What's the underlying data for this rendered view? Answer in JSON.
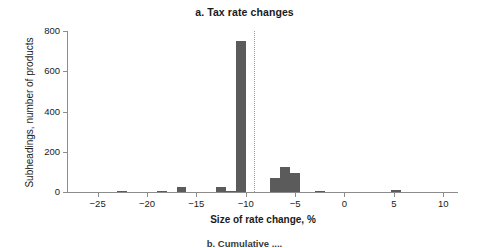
{
  "chart_data": {
    "type": "bar",
    "title": "a. Tax rate changes",
    "xlabel": "Size of rate change, %",
    "ylabel": "Subheadings, number of products",
    "xlim": [
      -28,
      11.5
    ],
    "ylim": [
      0,
      800
    ],
    "xticks": [
      -25,
      -20,
      -15,
      -10,
      -5,
      0,
      5,
      10
    ],
    "xtick_labels": [
      "−25",
      "−20",
      "−15",
      "−10",
      "−5",
      "0",
      "5",
      "10"
    ],
    "yticks": [
      0,
      200,
      400,
      600,
      800
    ],
    "ytick_labels": [
      "0",
      "200",
      "400",
      "600",
      "800"
    ],
    "grid": false,
    "legend": "none",
    "bar_color": "#5b5b5b",
    "bin_width": 1,
    "bars": [
      {
        "x": -22.5,
        "value": 4
      },
      {
        "x": -18.5,
        "value": 3
      },
      {
        "x": -16.5,
        "value": 26
      },
      {
        "x": -12.5,
        "value": 26
      },
      {
        "x": -11.5,
        "value": 7
      },
      {
        "x": -10.5,
        "value": 752
      },
      {
        "x": -7.0,
        "value": 70
      },
      {
        "x": -6.0,
        "value": 125
      },
      {
        "x": -5.0,
        "value": 95
      },
      {
        "x": -2.5,
        "value": 5
      },
      {
        "x": 5.2,
        "value": 9
      }
    ],
    "annotations": [
      {
        "type": "vertical-dashed-line",
        "x": -9.2,
        "style": "dotted",
        "color": "#9a9a9a"
      }
    ]
  },
  "caption_below": "b. Cumulative ...."
}
